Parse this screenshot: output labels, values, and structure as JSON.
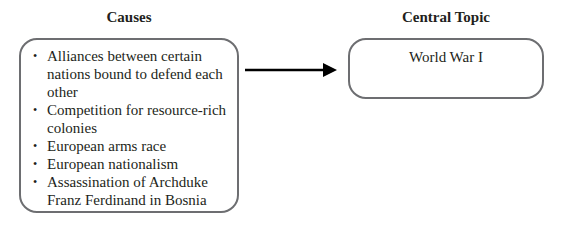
{
  "causes": {
    "heading": "Causes",
    "items": [
      "Alliances between certain nations bound to defend each other",
      "Competition for resource-rich colonies",
      "European arms race",
      "European nationalism",
      "Assassination of Archduke Franz Ferdinand in Bosnia"
    ]
  },
  "central_topic": {
    "heading": "Central Topic",
    "text": "World War I"
  },
  "colors": {
    "border": "#6d6e71",
    "text": "#231f20",
    "arrow": "#000000"
  }
}
